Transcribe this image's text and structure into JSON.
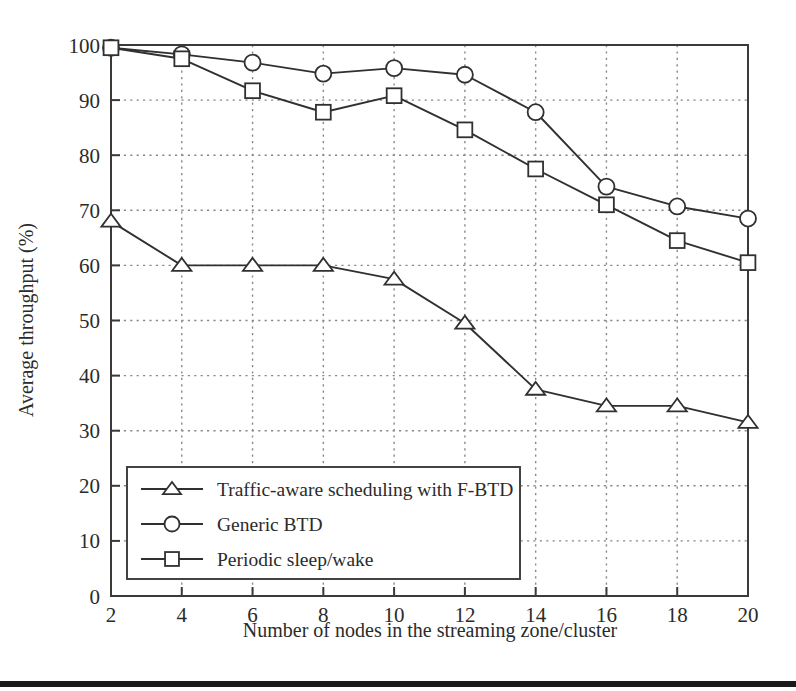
{
  "chart_data": {
    "type": "line",
    "title": "",
    "xlabel": "Number of nodes in the streaming zone/cluster",
    "ylabel": "Average throughput (%)",
    "x": [
      2,
      4,
      6,
      8,
      10,
      12,
      14,
      16,
      18,
      20
    ],
    "xlim": [
      2,
      20
    ],
    "ylim": [
      0,
      100
    ],
    "xticks": [
      "2",
      "4",
      "6",
      "8",
      "10",
      "12",
      "14",
      "16",
      "18",
      "20"
    ],
    "yticks": [
      "0",
      "10",
      "20",
      "30",
      "40",
      "50",
      "60",
      "70",
      "80",
      "90",
      "100"
    ],
    "grid": "dotted-both-axes",
    "legend_position": "lower-left",
    "series": [
      {
        "name": "Traffic-aware scheduling with F-BTD",
        "marker": "triangle",
        "color": "#303030",
        "values": [
          68.0,
          60.0,
          60.0,
          60.0,
          57.5,
          49.5,
          37.5,
          34.5,
          34.5,
          31.5
        ]
      },
      {
        "name": "Generic BTD",
        "marker": "circle",
        "color": "#303030",
        "values": [
          99.5,
          98.3,
          96.8,
          94.8,
          95.8,
          94.6,
          87.8,
          74.3,
          70.7,
          68.5
        ]
      },
      {
        "name": "Periodic sleep/wake",
        "marker": "square",
        "color": "#303030",
        "values": [
          99.5,
          97.5,
          91.7,
          87.8,
          90.8,
          84.6,
          77.5,
          71.0,
          64.5,
          60.5
        ]
      }
    ]
  },
  "figure": {
    "background_color": "#ffffff",
    "axis_color": "#3a3a3a",
    "grid_color": "#8a8a8a",
    "bottom_rule_color": "#1a1a1a"
  }
}
